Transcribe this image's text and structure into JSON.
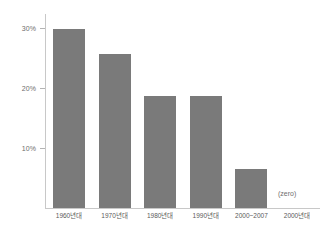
{
  "chart_data": {
    "type": "bar",
    "title": "",
    "xlabel": "",
    "ylabel": "",
    "categories": [
      "1960년대",
      "1970년대",
      "1980년대",
      "1990년대",
      "2000~2007",
      "2000년대"
    ],
    "values": [
      32,
      27.5,
      20,
      20,
      7,
      0
    ],
    "ylim": [
      0,
      34.7
    ],
    "ytick_values": [
      10,
      20,
      30
    ],
    "ytick_labels": [
      "10%",
      "20%",
      "30%"
    ],
    "grid": false,
    "legend": null,
    "annotations": [
      {
        "text": "(zero)",
        "category": "2000년대",
        "value": 0
      }
    ],
    "series": [
      {
        "name": "",
        "values": [
          32,
          27.5,
          20,
          20,
          7,
          0
        ]
      }
    ]
  },
  "style": {
    "bar_color": "#7a7a7a",
    "axis_color": "#c8c8c8",
    "text_color": "#5a5a5a",
    "background": "#ffffff"
  }
}
